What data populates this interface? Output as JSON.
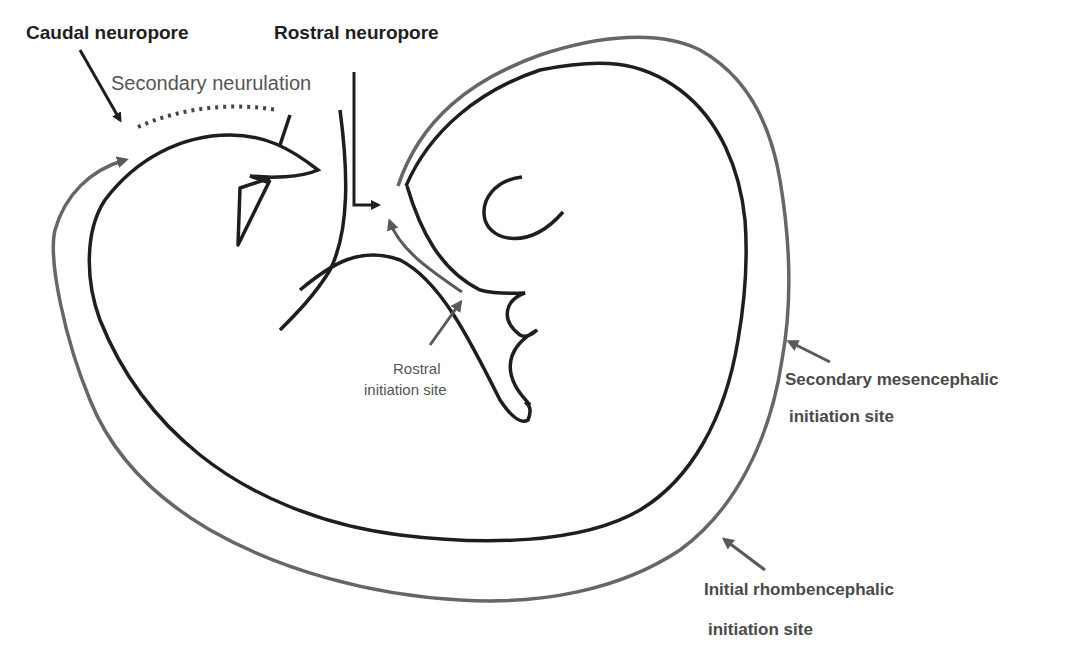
{
  "diagram": {
    "type": "embryo neurulation schematic",
    "colors": {
      "neural_tube": "#1e1e1e",
      "closure_wave": "#666666",
      "label_dark": "#1e1e1e",
      "label_grey": "#555555"
    }
  },
  "labels": {
    "caudal_neuropore": "Caudal neuropore",
    "rostral_neuropore": "Rostral neuropore",
    "secondary_neurulation": "Secondary neurulation",
    "rostral_initiation_line1": "Rostral",
    "rostral_initiation_line2": "initiation site",
    "secondary_mesencephalic_line1": "Secondary mesencephalic",
    "secondary_mesencephalic_line2": "initiation site",
    "initial_rhombencephalic_line1": "Initial rhombencephalic",
    "initial_rhombencephalic_line2": "initiation site"
  }
}
